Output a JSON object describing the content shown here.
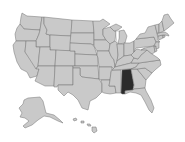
{
  "map": {
    "title": "",
    "type": "choropleth-us-states",
    "colors": {
      "background": "#ffffff",
      "default_fill": "#c9c9c9",
      "border": "#727272",
      "highlight_fill": "#2b2b2b"
    },
    "highlighted_states": [
      "Alabama"
    ],
    "states": [
      {
        "id": "WA",
        "name": "Washington",
        "highlighted": false
      },
      {
        "id": "OR",
        "name": "Oregon",
        "highlighted": false
      },
      {
        "id": "CA",
        "name": "California",
        "highlighted": false
      },
      {
        "id": "ID",
        "name": "Idaho",
        "highlighted": false
      },
      {
        "id": "NV",
        "name": "Nevada",
        "highlighted": false
      },
      {
        "id": "MT",
        "name": "Montana",
        "highlighted": false
      },
      {
        "id": "WY",
        "name": "Wyoming",
        "highlighted": false
      },
      {
        "id": "UT",
        "name": "Utah",
        "highlighted": false
      },
      {
        "id": "AZ",
        "name": "Arizona",
        "highlighted": false
      },
      {
        "id": "CO",
        "name": "Colorado",
        "highlighted": false
      },
      {
        "id": "NM",
        "name": "New Mexico",
        "highlighted": false
      },
      {
        "id": "ND",
        "name": "North Dakota",
        "highlighted": false
      },
      {
        "id": "SD",
        "name": "South Dakota",
        "highlighted": false
      },
      {
        "id": "NE",
        "name": "Nebraska",
        "highlighted": false
      },
      {
        "id": "KS",
        "name": "Kansas",
        "highlighted": false
      },
      {
        "id": "OK",
        "name": "Oklahoma",
        "highlighted": false
      },
      {
        "id": "TX",
        "name": "Texas",
        "highlighted": false
      },
      {
        "id": "MN",
        "name": "Minnesota",
        "highlighted": false
      },
      {
        "id": "IA",
        "name": "Iowa",
        "highlighted": false
      },
      {
        "id": "MO",
        "name": "Missouri",
        "highlighted": false
      },
      {
        "id": "AR",
        "name": "Arkansas",
        "highlighted": false
      },
      {
        "id": "LA",
        "name": "Louisiana",
        "highlighted": false
      },
      {
        "id": "WI",
        "name": "Wisconsin",
        "highlighted": false
      },
      {
        "id": "IL",
        "name": "Illinois",
        "highlighted": false
      },
      {
        "id": "MS",
        "name": "Mississippi",
        "highlighted": false
      },
      {
        "id": "MI",
        "name": "Michigan",
        "highlighted": false
      },
      {
        "id": "IN",
        "name": "Indiana",
        "highlighted": false
      },
      {
        "id": "KY",
        "name": "Kentucky",
        "highlighted": false
      },
      {
        "id": "TN",
        "name": "Tennessee",
        "highlighted": false
      },
      {
        "id": "AL",
        "name": "Alabama",
        "highlighted": true
      },
      {
        "id": "OH",
        "name": "Ohio",
        "highlighted": false
      },
      {
        "id": "GA",
        "name": "Georgia",
        "highlighted": false
      },
      {
        "id": "FL",
        "name": "Florida",
        "highlighted": false
      },
      {
        "id": "SC",
        "name": "South Carolina",
        "highlighted": false
      },
      {
        "id": "NC",
        "name": "North Carolina",
        "highlighted": false
      },
      {
        "id": "VA",
        "name": "Virginia",
        "highlighted": false
      },
      {
        "id": "WV",
        "name": "West Virginia",
        "highlighted": false
      },
      {
        "id": "PA",
        "name": "Pennsylvania",
        "highlighted": false
      },
      {
        "id": "NY",
        "name": "New York",
        "highlighted": false
      },
      {
        "id": "MD",
        "name": "Maryland",
        "highlighted": false
      },
      {
        "id": "DE",
        "name": "Delaware",
        "highlighted": false
      },
      {
        "id": "NJ",
        "name": "New Jersey",
        "highlighted": false
      },
      {
        "id": "CT",
        "name": "Connecticut",
        "highlighted": false
      },
      {
        "id": "RI",
        "name": "Rhode Island",
        "highlighted": false
      },
      {
        "id": "MA",
        "name": "Massachusetts",
        "highlighted": false
      },
      {
        "id": "VT",
        "name": "Vermont",
        "highlighted": false
      },
      {
        "id": "NH",
        "name": "New Hampshire",
        "highlighted": false
      },
      {
        "id": "ME",
        "name": "Maine",
        "highlighted": false
      },
      {
        "id": "AK",
        "name": "Alaska",
        "highlighted": false
      },
      {
        "id": "HI",
        "name": "Hawaii",
        "highlighted": false
      }
    ]
  }
}
